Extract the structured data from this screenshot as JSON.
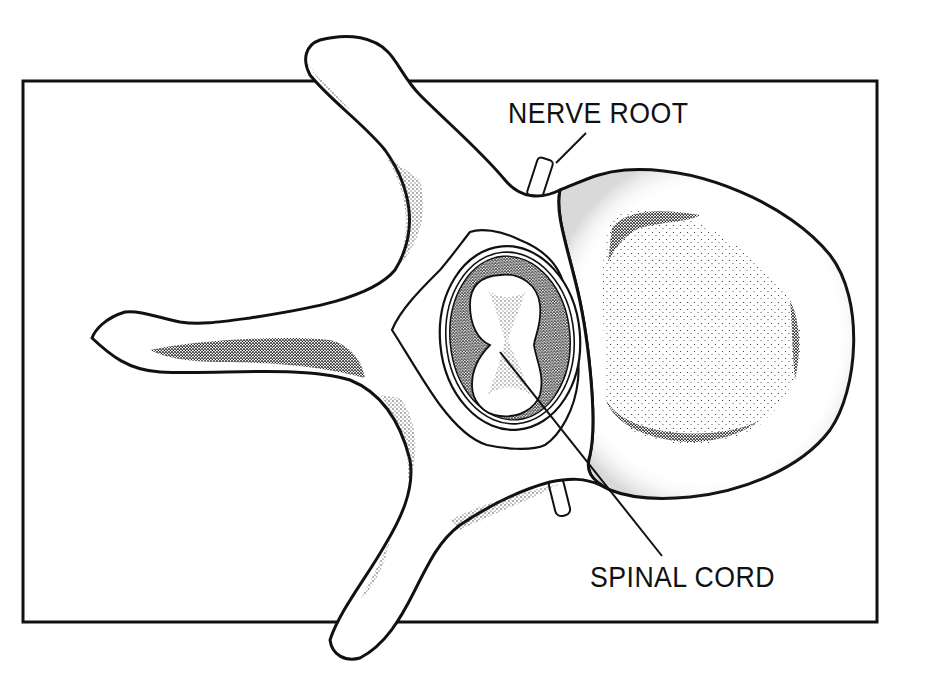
{
  "figure": {
    "frame": {
      "x": 22,
      "y": 80,
      "width": 856,
      "height": 543,
      "stroke": "#111111"
    },
    "colors": {
      "ink": "#111111",
      "paper": "#ffffff",
      "stipple": "#222222"
    }
  },
  "labels": {
    "nerve_root": {
      "text": "NERVE ROOT",
      "x": 508,
      "y": 99,
      "leader": {
        "x1": 586,
        "y1": 133,
        "x2": 556,
        "y2": 163
      }
    },
    "spinal_cord": {
      "text": "SPINAL CORD",
      "x": 590,
      "y": 563,
      "leader": {
        "x1": 500,
        "y1": 352,
        "x2": 662,
        "y2": 556
      }
    }
  },
  "structures": [
    {
      "name": "vertebral-body"
    },
    {
      "name": "spinal-canal"
    },
    {
      "name": "spinal-cord"
    },
    {
      "name": "transverse-process-upper"
    },
    {
      "name": "transverse-process-left"
    },
    {
      "name": "spinous-process-lower"
    },
    {
      "name": "nerve-root-upper"
    },
    {
      "name": "nerve-root-lower"
    }
  ]
}
